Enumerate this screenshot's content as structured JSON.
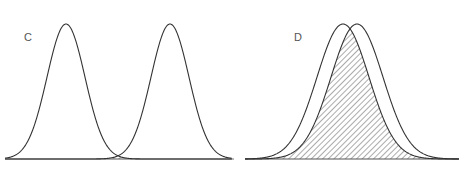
{
  "chart_data": [
    {
      "type": "area",
      "panel": "C",
      "title": "C",
      "description": "Two well-separated normal distributions with a small hatched overlap region at the tails",
      "series": [
        {
          "name": "left-distribution",
          "mean_px": 66,
          "sigma_px": 19,
          "peak_y_px": 24
        },
        {
          "name": "right-distribution",
          "mean_px": 170,
          "sigma_px": 19,
          "peak_y_px": 24
        }
      ],
      "overlap": "small hatched area near x=118",
      "baseline": {
        "x_start": 5,
        "x_end": 232,
        "y": 159
      },
      "grid": false,
      "xlabel": "",
      "ylabel": ""
    },
    {
      "type": "area",
      "panel": "D",
      "title": "D",
      "description": "Two heavily overlapping normal distributions with a large hatched overlap region",
      "series": [
        {
          "name": "left-distribution",
          "mean_px": 343,
          "sigma_px": 26,
          "peak_y_px": 24
        },
        {
          "name": "right-distribution",
          "mean_px": 357,
          "sigma_px": 26,
          "peak_y_px": 24
        }
      ],
      "overlap": "large hatched area covering most of both curves",
      "baseline": {
        "x_start": 245,
        "x_end": 459,
        "y": 159
      },
      "grid": false,
      "xlabel": "",
      "ylabel": ""
    }
  ],
  "labels": {
    "panel_c": "C",
    "panel_d": "D"
  },
  "colors": {
    "line": "#333333",
    "baseline": "#555555",
    "hatch": "#444444",
    "label": "#555555"
  }
}
